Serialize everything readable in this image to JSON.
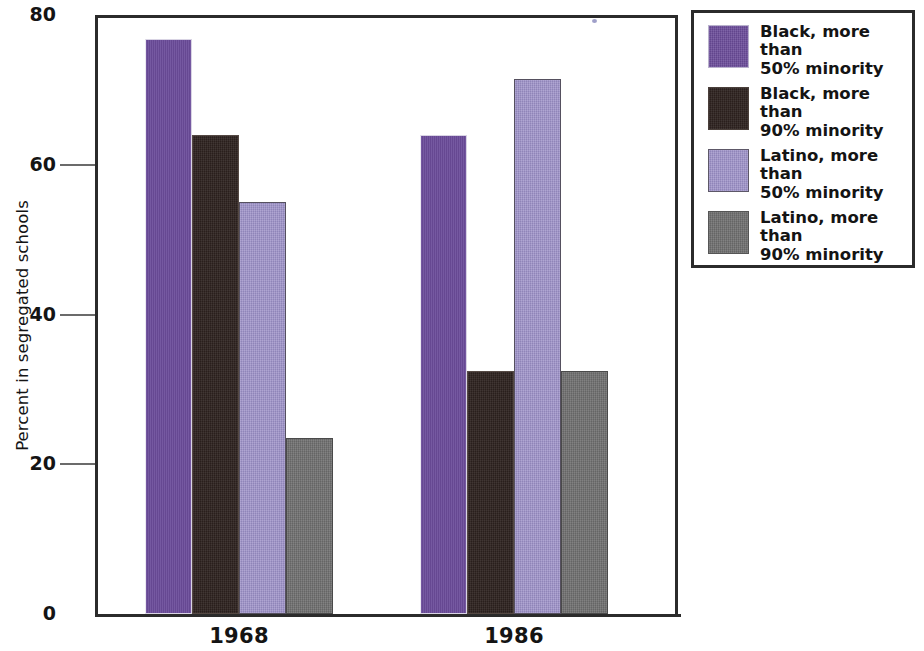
{
  "chart_data": {
    "type": "bar",
    "title": "",
    "xlabel": "",
    "ylabel": "Percent in segregated schools",
    "ylim": [
      0,
      80
    ],
    "yticks": [
      0,
      20,
      40,
      60,
      80
    ],
    "ytick_labels": [
      "0",
      "20",
      "40",
      "60",
      "80"
    ],
    "grid": false,
    "legend_position": "right",
    "categories": [
      "1968",
      "1986"
    ],
    "series": [
      {
        "name": "Black, more than 50% minority",
        "color": "#6B4C9A",
        "values": [
          76.8,
          64.0
        ]
      },
      {
        "name": "Black, more than 90% minority",
        "color": "#2E2320",
        "values": [
          64.0,
          32.5
        ]
      },
      {
        "name": "Latino, more than 50% minority",
        "color": "#9A8EC6",
        "values": [
          55.0,
          71.5
        ]
      },
      {
        "name": "Latino, more than 90% minority",
        "color": "#6E6E6E",
        "values": [
          23.5,
          32.5
        ]
      }
    ]
  },
  "axis": {
    "y_title": "Percent in segregated schools",
    "y_tick_labels": [
      "80",
      "60",
      "40",
      "20",
      "0"
    ],
    "x_tick_labels": [
      "1968",
      "1986"
    ]
  },
  "legend": {
    "items": [
      {
        "label": "Black, more than\n50% minority",
        "swatch": "s0"
      },
      {
        "label": "Black, more than\n90% minority",
        "swatch": "s1"
      },
      {
        "label": "Latino, more than\n50% minority",
        "swatch": "s2"
      },
      {
        "label": "Latino, more than\n90% minority",
        "swatch": "s3"
      }
    ]
  }
}
